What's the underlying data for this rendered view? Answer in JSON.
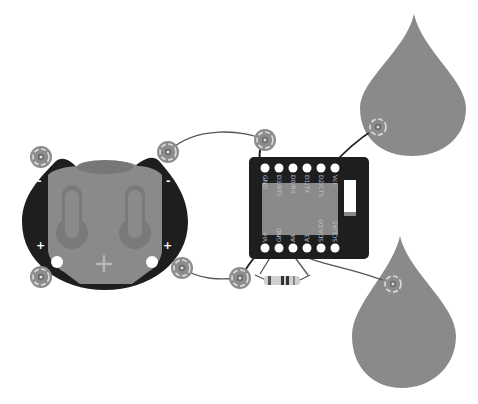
{
  "diagram": {
    "type": "circuit-wiring",
    "colors": {
      "board": "#1e1e1e",
      "board_inner": "#8a8a8a",
      "drop": "#8a8a8a",
      "wire": "#555555",
      "snap_outer": "#8c8c8c",
      "snap_ring": "#dcdcdc",
      "pad": "#ffffff"
    },
    "battery_holder": {
      "polarity_labels": {
        "neg_left": "-",
        "neg_right": "-",
        "pos_left": "+",
        "pos_right": "+"
      },
      "center_symbol": "+"
    },
    "microcontroller": {
      "top_pins": [
        "GND",
        "D3/RTS",
        "D0/RX",
        "D1/TX",
        "D2/CTS",
        "Vcc"
      ],
      "bottom_pins": [
        "Vin",
        "GND",
        "A4",
        "A3",
        "SDA/D0",
        "SCL/A5"
      ]
    },
    "components": [
      {
        "name": "coin-cell-battery-holder"
      },
      {
        "name": "microcontroller-board"
      },
      {
        "name": "resistor"
      },
      {
        "name": "conductive-pad-top"
      },
      {
        "name": "conductive-pad-bottom"
      }
    ]
  }
}
